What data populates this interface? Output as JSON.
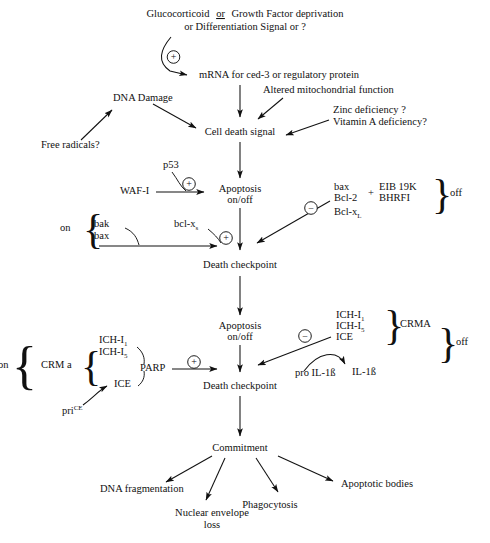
{
  "diagram": {
    "nodes": {
      "stimulus_line1_a": "Glucocorticoid",
      "stimulus_line1_or": "or",
      "stimulus_line1_b": "Growth Factor deprivation",
      "stimulus_line2": "or Differentiation Signal or ?",
      "mrna": "mRNA for ced-3 or regulatory protein",
      "altered_mito": "Altered mitochondrial function",
      "dna_damage": "DNA Damage",
      "free_radicals": "Free radicals?",
      "zinc_def": "Zinc deficiency ?",
      "vitamin_a_def": "Vitamin A deficiency?",
      "cell_death_signal": "Cell death signal",
      "apoptosis_1_line1": "Apoptosis",
      "apoptosis_1_line2": "on/off",
      "death_checkpoint_1": "Death checkpoint",
      "apoptosis_2_line1": "Apoptosis",
      "apoptosis_2_line2": "on/off",
      "death_checkpoint_2": "Death checkpoint",
      "commitment": "Commitment",
      "dna_fragmentation": "DNA fragmentation",
      "nuclear_envelope_line1": "Nuclear envelope",
      "nuclear_envelope_line2": "loss",
      "phagocytosis": "Phagocytosis",
      "apoptotic_bodies": "Apoptotic bodies"
    },
    "regulators": {
      "p53": "p53",
      "waf1": "WAF-I",
      "on_label_upper": "on",
      "bak": "bak",
      "bax_lower": "bax",
      "bcl_xs_base": "bcl-x",
      "bcl_xs_sub": "s",
      "inhibitor_bax": "bax",
      "inhibitor_bcl2": "Bcl-2",
      "inhibitor_bclxl_base": "Bcl-x",
      "inhibitor_bclxl_sub": "L",
      "plus_join": "+",
      "eib19k": "EIB 19K",
      "bhrfi": "BHRFI",
      "off_label_upper": "off",
      "on_label_lower": "on",
      "crma_left": "CRM a",
      "ich_i1_base": "ICH-I",
      "ich_i1_sub": "1",
      "ich_i5_base": "ICH-I",
      "ich_i5_sub": "5",
      "ice_left": "ICE",
      "parp": "PARP",
      "price_base": "pri",
      "price_sup": "CE",
      "ich_i1_right_base": "ICH-I",
      "ich_i1_right_sub": "1",
      "ich_i5_right_base": "ICH-I",
      "ich_i5_right_sub": "5",
      "ice_right": "ICE",
      "crma_right": "CRMA",
      "off_label_lower": "off",
      "pro_il1b": "pro IL-1ß",
      "il1b": "IL-1ß"
    },
    "signs": {
      "plus": "+",
      "minus": "−"
    },
    "colors": {
      "ink": "#111111",
      "background": "#ffffff"
    }
  }
}
